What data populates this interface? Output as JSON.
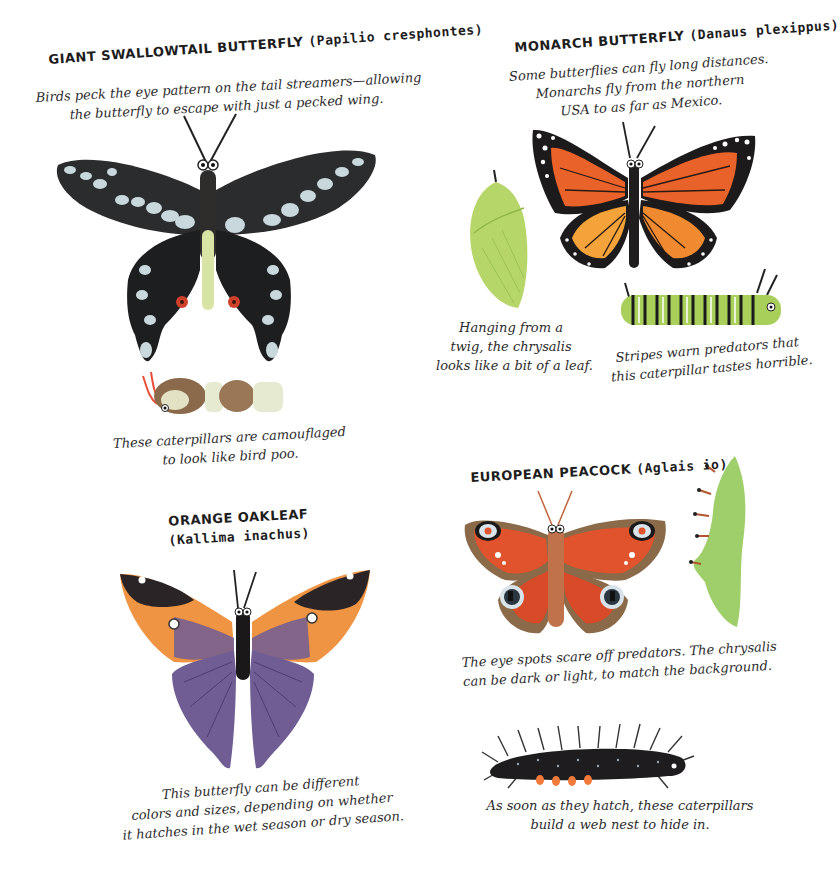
{
  "page": {
    "type": "illustrated-book-spread",
    "background": "#ffffff"
  },
  "sections": {
    "giant_swallowtail": {
      "title_common": "GIANT SWALLOWTAIL BUTTERFLY",
      "title_latin": "(Papilio cresphontes)",
      "description_lines": [
        "Birds peck the eye pattern on the tail streamers—allowing",
        "the butterfly to escape with just a pecked wing."
      ],
      "caterpillar_caption_lines": [
        "These caterpillars are camouflaged",
        "to look like bird poo."
      ],
      "colors": {
        "wing": "#222426",
        "spots": "#c9d8dc",
        "body_stripe": "#d8e3a6",
        "eyespot": "#d0402b"
      }
    },
    "monarch": {
      "title_common": "MONARCH BUTTERFLY",
      "title_latin": "(Danaus plexippus)",
      "description_lines": [
        "Some butterflies can fly long distances.",
        "Monarchs fly from the northern",
        "USA to as far as Mexico."
      ],
      "chrysalis_caption_lines": [
        "Hanging from a",
        "twig, the chrysalis",
        "looks like a bit of a leaf."
      ],
      "caterpillar_caption_lines": [
        "Stripes warn predators that",
        "this caterpillar tastes horrible."
      ],
      "colors": {
        "wing": "#e8622a",
        "wing_light": "#f4a23a",
        "border": "#1c1a1a",
        "chrysalis": "#b6d66a",
        "caterpillar": "#a8cf5a"
      }
    },
    "orange_oakleaf": {
      "title_common": "ORANGE OAKLEAF",
      "title_latin": "(Kallima inachus)",
      "caption_lines": [
        "This butterfly can be different",
        "colors and sizes, depending on whether",
        "it hatches in the wet season or dry season."
      ],
      "colors": {
        "tip": "#2a2426",
        "band": "#ef9442",
        "wing": "#6f5d94"
      }
    },
    "european_peacock": {
      "title_common": "EUROPEAN PEACOCK",
      "title_latin": "(Aglais io)",
      "caption_lines": [
        "The eye spots scare off predators. The chrysalis",
        "can be dark or light, to match the background."
      ],
      "caterpillar_caption_lines": [
        "As soon as they hatch, these caterpillars",
        "build a web nest to hide in."
      ],
      "colors": {
        "wing": "#e0532c",
        "edge": "#8a6a48",
        "eye_ring": "#d9e3ea",
        "chrysalis": "#9fcf6a",
        "caterpillar": "#1e1c1f",
        "prolegs": "#ef7a3c"
      }
    }
  }
}
